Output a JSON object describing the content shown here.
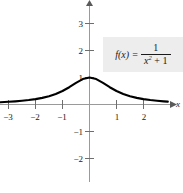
{
  "figure": {
    "type": "graph",
    "background": "#ffffff",
    "curve_color": "#000000",
    "axis_color": "#9a9a9a",
    "box_color": "#ededed"
  },
  "chart_data": {
    "type": "line",
    "title": "",
    "xlabel": "x",
    "ylabel": "",
    "function_label": "f(x) = 1/(x^2 + 1)",
    "equation": {
      "lhs": "f(x)",
      "equals": "=",
      "numerator": "1",
      "denominator_base": "x",
      "denominator_exponent": "2",
      "denominator_operator": "+",
      "denominator_constant": "1"
    },
    "xlim": [
      -3.3,
      3.1
    ],
    "ylim": [
      -2.6,
      3.4
    ],
    "grid": false,
    "legend": "none",
    "xticks": [
      -3,
      -2,
      -1,
      1,
      2
    ],
    "xtick_labels": [
      "−3",
      "−2",
      "−1",
      "1",
      "2"
    ],
    "yticks": [
      -2,
      -1,
      1,
      2,
      3
    ],
    "ytick_labels": [
      "−2",
      "−1",
      "1",
      "2",
      "3"
    ],
    "x": [
      -3.3,
      -3.0,
      -2.75,
      -2.5,
      -2.25,
      -2.0,
      -1.75,
      -1.5,
      -1.25,
      -1.0,
      -0.75,
      -0.5,
      -0.25,
      0.0,
      0.25,
      0.5,
      0.75,
      1.0,
      1.25,
      1.5,
      1.75,
      2.0,
      2.25,
      2.5,
      2.75,
      2.9
    ],
    "y": [
      0.084,
      0.1,
      0.117,
      0.138,
      0.165,
      0.2,
      0.246,
      0.308,
      0.39,
      0.5,
      0.64,
      0.8,
      0.941,
      1.0,
      0.941,
      0.8,
      0.64,
      0.5,
      0.39,
      0.308,
      0.246,
      0.2,
      0.165,
      0.138,
      0.117,
      0.106
    ]
  },
  "labels": {
    "x_axis": "x"
  }
}
